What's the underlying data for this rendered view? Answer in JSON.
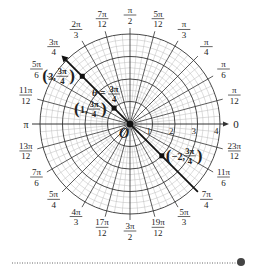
{
  "diagram": {
    "center_label": "O",
    "grid": {
      "rings": [
        1,
        2,
        3,
        4
      ],
      "minor_rings_per_unit": 4,
      "ray_step_deg": 15,
      "minor_ray_step_deg": 5
    },
    "axis": {
      "ticks": [
        "1",
        "2",
        "3",
        "4"
      ],
      "direction_label": "0"
    },
    "angle_labels": [
      {
        "deg": 0,
        "num": "",
        "den": "",
        "text": "0"
      },
      {
        "deg": 15,
        "num": "π",
        "den": "12"
      },
      {
        "deg": 30,
        "num": "π",
        "den": "6"
      },
      {
        "deg": 45,
        "num": "π",
        "den": "4"
      },
      {
        "deg": 60,
        "num": "π",
        "den": "3"
      },
      {
        "deg": 75,
        "num": "5π",
        "den": "12"
      },
      {
        "deg": 90,
        "num": "π",
        "den": "2"
      },
      {
        "deg": 105,
        "num": "7π",
        "den": "12"
      },
      {
        "deg": 120,
        "num": "2π",
        "den": "3"
      },
      {
        "deg": 135,
        "num": "3π",
        "den": "4"
      },
      {
        "deg": 150,
        "num": "5π",
        "den": "6"
      },
      {
        "deg": 165,
        "num": "11π",
        "den": "12"
      },
      {
        "deg": 180,
        "num": "",
        "den": "",
        "text": "π"
      },
      {
        "deg": 195,
        "num": "13π",
        "den": "12"
      },
      {
        "deg": 210,
        "num": "7π",
        "den": "6"
      },
      {
        "deg": 225,
        "num": "5π",
        "den": "4"
      },
      {
        "deg": 240,
        "num": "4π",
        "den": "3"
      },
      {
        "deg": 255,
        "num": "17π",
        "den": "12"
      },
      {
        "deg": 270,
        "num": "3π",
        "den": "2"
      },
      {
        "deg": 285,
        "num": "19π",
        "den": "12"
      },
      {
        "deg": 300,
        "num": "5π",
        "den": "3"
      },
      {
        "deg": 315,
        "num": "7π",
        "den": "4"
      },
      {
        "deg": 330,
        "num": "11π",
        "den": "6"
      },
      {
        "deg": 345,
        "num": "23π",
        "den": "12"
      }
    ],
    "highlight_line": {
      "label_prefix": "θ = ",
      "num": "3π",
      "den": "4"
    },
    "points": [
      {
        "r": 3,
        "theta_deg": 135,
        "r_text": "3",
        "num": "3π",
        "den": "4"
      },
      {
        "r": 1,
        "theta_deg": 135,
        "r_text": "1",
        "num": "3π",
        "den": "4"
      },
      {
        "r": -2,
        "theta_deg": 135,
        "r_text": "−2",
        "num": "3π",
        "den": "4"
      }
    ],
    "colors": {
      "major": "#333333",
      "minor": "#bbbbbb",
      "text": "#222222",
      "marker": "#111111"
    }
  }
}
